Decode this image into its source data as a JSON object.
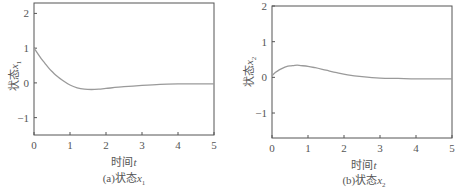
{
  "chart_data": [
    {
      "type": "line",
      "title": "(a)状态x1",
      "caption_prefix": "(a)状态",
      "caption_var": "x",
      "caption_sub": "1",
      "xlabel_prefix": "时间",
      "xlabel_var": "t",
      "ylabel_prefix": "状态",
      "ylabel_var": "x",
      "ylabel_sub": "1",
      "xlim": [
        0,
        5
      ],
      "ylim": [
        -1.5,
        2.3
      ],
      "xticks": [
        0,
        1,
        2,
        3,
        4,
        5
      ],
      "yticks": [
        -1,
        0,
        1,
        2
      ],
      "ytick_labels": [
        "−1",
        "0",
        "1",
        "2"
      ],
      "grid": false,
      "series": [
        {
          "name": "x1",
          "color": "#9a9a9a",
          "x": [
            0,
            0.1,
            0.2,
            0.3,
            0.4,
            0.5,
            0.6,
            0.8,
            1.0,
            1.2,
            1.4,
            1.6,
            1.8,
            2.0,
            2.5,
            3.0,
            3.5,
            4.0,
            4.5,
            5.0
          ],
          "y": [
            1.0,
            0.85,
            0.7,
            0.57,
            0.44,
            0.33,
            0.23,
            0.07,
            -0.06,
            -0.14,
            -0.18,
            -0.19,
            -0.18,
            -0.16,
            -0.11,
            -0.07,
            -0.04,
            -0.03,
            -0.03,
            -0.03
          ]
        }
      ]
    },
    {
      "type": "line",
      "title": "(b)状态x2",
      "caption_prefix": "(b)状态",
      "caption_var": "x",
      "caption_sub": "2",
      "xlabel_prefix": "时间",
      "xlabel_var": "t",
      "ylabel_prefix": "状态",
      "ylabel_var": "x",
      "ylabel_sub": "2",
      "xlim": [
        0,
        5
      ],
      "ylim": [
        -1.7,
        2.0
      ],
      "xticks": [
        0,
        1,
        2,
        3,
        4,
        5
      ],
      "yticks": [
        -1,
        0,
        1,
        2
      ],
      "ytick_labels": [
        "−1",
        "0",
        "1",
        "2"
      ],
      "grid": false,
      "series": [
        {
          "name": "x2",
          "color": "#9a9a9a",
          "x": [
            0,
            0.1,
            0.2,
            0.3,
            0.4,
            0.5,
            0.6,
            0.7,
            0.8,
            1.0,
            1.2,
            1.5,
            1.8,
            2.1,
            2.5,
            3.0,
            3.5,
            4.0,
            4.5,
            5.0
          ],
          "y": [
            0.05,
            0.14,
            0.21,
            0.26,
            0.3,
            0.32,
            0.33,
            0.34,
            0.33,
            0.31,
            0.27,
            0.2,
            0.13,
            0.07,
            0.02,
            -0.02,
            -0.03,
            -0.04,
            -0.04,
            -0.04
          ]
        }
      ]
    }
  ]
}
